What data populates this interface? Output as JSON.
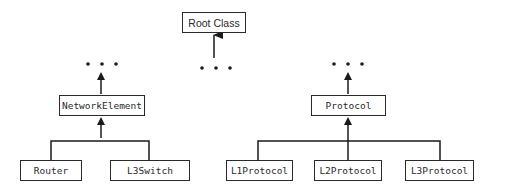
{
  "diagram": {
    "type": "class-hierarchy",
    "root": {
      "label": "Root Class"
    },
    "ellipsis": "• • •",
    "branches": [
      {
        "parent": "NetworkElement",
        "children": [
          "Router",
          "L3Switch"
        ]
      },
      {
        "parent": "Protocol",
        "children": [
          "L1Protocol",
          "L2Protocol",
          "L3Protocol"
        ]
      }
    ]
  },
  "nodes": {
    "root": "Root Class",
    "network_element": "NetworkElement",
    "router": "Router",
    "l3switch": "L3Switch",
    "protocol": "Protocol",
    "l1protocol": "L1Protocol",
    "l2protocol": "L2Protocol",
    "l3protocol": "L3Protocol"
  },
  "colors": {
    "stroke": "#2a2a2a",
    "background": "#ffffff"
  }
}
